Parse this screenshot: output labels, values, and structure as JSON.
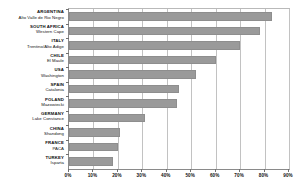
{
  "chart_data": {
    "type": "bar",
    "orientation": "horizontal",
    "title": "",
    "xlabel": "",
    "ylabel": "",
    "xlim": [
      0,
      90
    ],
    "xtick_labels": [
      "0%",
      "10%",
      "20%",
      "30%",
      "40%",
      "50%",
      "60%",
      "70%",
      "80%",
      "90%"
    ],
    "xtick_values": [
      0,
      10,
      20,
      30,
      40,
      50,
      60,
      70,
      80,
      90
    ],
    "grid": true,
    "legend": false,
    "bar_color": "#9a9a9a",
    "categories": [
      "Alto Valle de Rio Negro",
      "Western Cape",
      "Trentino/Alto Adige",
      "El Maule",
      "Washington",
      "Catalonia",
      "Mazowiecki",
      "Lake Constance",
      "Shandong",
      "PACA",
      "Isparta"
    ],
    "values": [
      83,
      78,
      70,
      60,
      52,
      45,
      44,
      31,
      21,
      20,
      18
    ],
    "rows": [
      {
        "country": "ARGENTINA",
        "region": "Alto Valle de Rio Negro",
        "value": 83
      },
      {
        "country": "SOUTH AFRICA",
        "region": "Western Cape",
        "value": 78
      },
      {
        "country": "ITALY",
        "region": "Trentino/Alto Adige",
        "value": 70
      },
      {
        "country": "CHILE",
        "region": "El Maule",
        "value": 60
      },
      {
        "country": "USA",
        "region": "Washington",
        "value": 52
      },
      {
        "country": "SPAIN",
        "region": "Catalonia",
        "value": 45
      },
      {
        "country": "POLAND",
        "region": "Mazowiecki",
        "value": 44
      },
      {
        "country": "GERMANY",
        "region": "Lake Constance",
        "value": 31
      },
      {
        "country": "CHINA",
        "region": "Shandong",
        "value": 21
      },
      {
        "country": "FRANCE",
        "region": "PACA",
        "value": 20
      },
      {
        "country": "TURKEY",
        "region": "Isparta",
        "value": 18
      }
    ]
  }
}
